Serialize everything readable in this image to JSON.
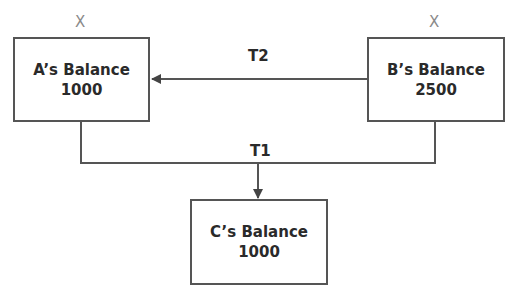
{
  "nodes": {
    "a": {
      "title": "A’s Balance",
      "value": "1000",
      "mark": "X"
    },
    "b": {
      "title": "B’s Balance",
      "value": "2500",
      "mark": "X"
    },
    "c": {
      "title": "C’s Balance",
      "value": "1000"
    }
  },
  "edges": {
    "t2": {
      "label": "T2",
      "from": "B",
      "to": "A"
    },
    "t1": {
      "label": "T1",
      "from": [
        "A",
        "B"
      ],
      "to": "C"
    }
  },
  "colors": {
    "stroke": "#555555",
    "mark": "#8a8a8a",
    "text": "#2a2a2a"
  }
}
